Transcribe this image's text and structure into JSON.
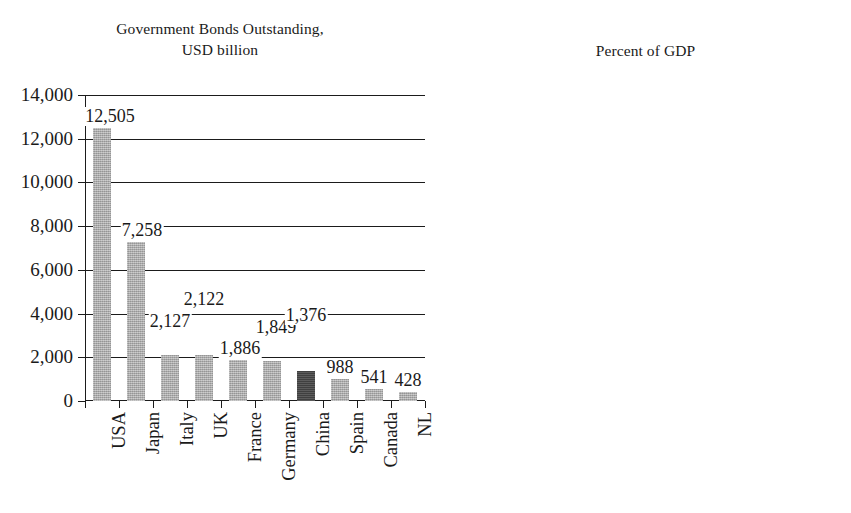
{
  "chart_data": [
    {
      "id": "bonds-outstanding",
      "type": "bar",
      "title": "Government Bonds Outstanding,\nUSD billion",
      "xlabel": "",
      "ylabel": "",
      "ylim": [
        0,
        14000
      ],
      "ytick_step": 2000,
      "grid": true,
      "legend": "none",
      "ytick_labels": [
        "14,000",
        "12,000",
        "10,000",
        "8,000",
        "6,000",
        "4,000",
        "2,000",
        "0"
      ],
      "ytick_values": [
        14000,
        12000,
        10000,
        8000,
        6000,
        4000,
        2000,
        0
      ],
      "categories": [
        "USA",
        "Japan",
        "Italy",
        "UK",
        "France",
        "Germany",
        "China",
        "Spain",
        "Canada",
        "NL"
      ],
      "values": [
        12505,
        7258,
        2127,
        2122,
        1886,
        1849,
        1376,
        988,
        541,
        428
      ],
      "value_labels": [
        "12,505",
        "7,258",
        "2,127",
        "2,122",
        "1,886",
        "1,849",
        "1,376",
        "988",
        "541",
        "428"
      ],
      "highlight_index": 6,
      "bar_color": "#a8a8a8",
      "highlight_color": "#4a4a4a"
    },
    {
      "id": "percent-of-gdp",
      "type": "bar",
      "title": "Percent of GDP",
      "xlabel": "",
      "ylabel": "",
      "ylim": [
        0,
        160
      ],
      "ytick_step": 20,
      "grid": true,
      "legend": "none",
      "ytick_labels": [
        "160",
        "140",
        "120",
        "100",
        "80",
        "60",
        "40",
        "20",
        "0"
      ],
      "ytick_values": [
        160,
        140,
        120,
        100,
        80,
        60,
        40,
        20,
        0
      ],
      "categories": [
        "Japan",
        "Italy",
        "Spain",
        "UK",
        "USA",
        "France",
        "Canada",
        "Germany",
        "NL",
        "China"
      ],
      "values": [
        152,
        99,
        71,
        71,
        71,
        67,
        49,
        39,
        30,
        13
      ],
      "value_labels": [
        "152",
        "99",
        "71",
        "71",
        "71",
        "67",
        "49",
        "39",
        "30",
        "13"
      ],
      "highlight_index": 9,
      "bar_color": "#a8a8a8",
      "highlight_color": "#4a4a4a"
    }
  ]
}
